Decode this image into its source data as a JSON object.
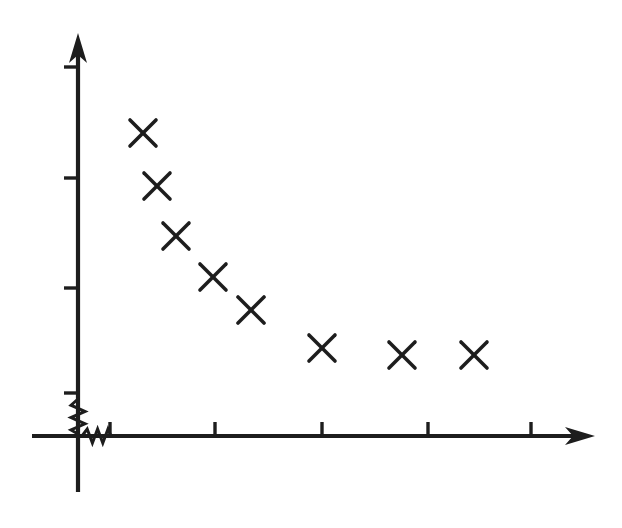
{
  "figure": {
    "background_color": "#ffffff",
    "ink_color": "#1d1d1d",
    "title": "",
    "caption": ""
  },
  "chart_data": {
    "type": "scatter",
    "title": "",
    "subtitle": "",
    "xlabel": "",
    "ylabel": "",
    "marker": "x-cross",
    "marker_color": "#1d1d1d",
    "marker_size_px": 26,
    "grid": false,
    "legend": null,
    "legend_position": "none",
    "axis_break_x": true,
    "axis_break_y": true,
    "annotations": [],
    "tick_labels_x": [],
    "tick_labels_y": [],
    "x_tick_count": 5,
    "y_tick_count": 4,
    "xlim": [
      0,
      6
    ],
    "ylim": [
      0,
      5
    ],
    "x": [
      1.3,
      1.5,
      1.7,
      2.05,
      2.4,
      3.15,
      3.95,
      4.65
    ],
    "y": [
      3.95,
      3.45,
      3.0,
      2.6,
      2.3,
      1.95,
      1.9,
      1.9
    ],
    "points": [
      {
        "index": 1,
        "x": 1.3,
        "y": 3.95,
        "px": 143,
        "py": 133
      },
      {
        "index": 2,
        "x": 1.5,
        "y": 3.45,
        "px": 157,
        "py": 186
      },
      {
        "index": 3,
        "x": 1.7,
        "y": 3.0,
        "px": 176,
        "py": 236
      },
      {
        "index": 4,
        "x": 2.05,
        "y": 2.6,
        "px": 213,
        "py": 277
      },
      {
        "index": 5,
        "x": 2.4,
        "y": 2.3,
        "px": 251,
        "py": 310
      },
      {
        "index": 6,
        "x": 3.15,
        "y": 1.95,
        "px": 322,
        "py": 348
      },
      {
        "index": 7,
        "x": 3.95,
        "y": 1.9,
        "px": 402,
        "py": 355
      },
      {
        "index": 8,
        "x": 4.65,
        "y": 1.9,
        "px": 474,
        "py": 355
      }
    ]
  },
  "axes": {
    "y_axis": {
      "origin_px": 78,
      "top_px": 33,
      "bottom_px": 492,
      "tick_length_px": 14,
      "ticks_py": [
        67,
        178,
        288,
        393
      ],
      "break_from_py": 399,
      "break_to_py": 430
    },
    "x_axis": {
      "origin_py": 436,
      "left_px": 32,
      "right_px": 595,
      "tick_length_px": 14,
      "ticks_px": [
        110,
        215,
        322,
        428,
        531
      ],
      "break_from_px": 82,
      "break_to_px": 108
    }
  }
}
